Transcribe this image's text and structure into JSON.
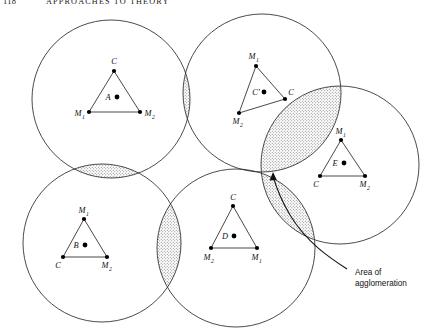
{
  "page": {
    "folio": "118",
    "running_head": "APPROACHES TO THEORY",
    "width": 424,
    "height": 331
  },
  "figure": {
    "name": "agglomeration-isodapane-diagram",
    "stroke_color": "#2b2b2b",
    "stipple_color": "#5a5a5a",
    "dense_fill_color": "#2a2a2a",
    "background": "#ffffff",
    "circles": [
      {
        "id": "circle-a",
        "cx": 111,
        "cy": 99,
        "r": 79
      },
      {
        "id": "circle-c",
        "cx": 262,
        "cy": 93,
        "r": 79
      },
      {
        "id": "circle-e",
        "cx": 340,
        "cy": 165,
        "r": 79
      },
      {
        "id": "circle-b",
        "cx": 102,
        "cy": 243,
        "r": 79
      },
      {
        "id": "circle-d",
        "cx": 236,
        "cy": 248,
        "r": 79
      }
    ],
    "triangles": [
      {
        "id": "triangle-a",
        "inner_label": "A",
        "inner_point": {
          "x": 117,
          "y": 97
        },
        "vertices": [
          {
            "label": "C",
            "sub": "",
            "x": 114,
            "y": 71,
            "anchor": "mid",
            "pos": "above"
          },
          {
            "label": "M",
            "sub": "1",
            "x": 89,
            "y": 112,
            "anchor": "right",
            "pos": "left"
          },
          {
            "label": "M",
            "sub": "2",
            "x": 140,
            "y": 112,
            "anchor": "left",
            "pos": "right"
          }
        ]
      },
      {
        "id": "triangle-c",
        "inner_label": "C'",
        "inner_point": {
          "x": 264,
          "y": 92
        },
        "vertices": [
          {
            "label": "M",
            "sub": "1",
            "x": 256,
            "y": 66,
            "anchor": "mid",
            "pos": "above"
          },
          {
            "label": "M",
            "sub": "2",
            "x": 239,
            "y": 113,
            "anchor": "mid",
            "pos": "below"
          },
          {
            "label": "C",
            "sub": "",
            "x": 285,
            "y": 99,
            "anchor": "left",
            "pos": "right"
          }
        ]
      },
      {
        "id": "triangle-e",
        "inner_label": "E",
        "inner_point": {
          "x": 344,
          "y": 163
        },
        "vertices": [
          {
            "label": "M",
            "sub": "1",
            "x": 341,
            "y": 140,
            "anchor": "mid",
            "pos": "above"
          },
          {
            "label": "C",
            "sub": "",
            "x": 320,
            "y": 176,
            "anchor": "right",
            "pos": "left"
          },
          {
            "label": "M",
            "sub": "2",
            "x": 365,
            "y": 176,
            "anchor": "left",
            "pos": "right"
          }
        ]
      },
      {
        "id": "triangle-b",
        "inner_label": "B",
        "inner_point": {
          "x": 85,
          "y": 245
        },
        "vertices": [
          {
            "label": "M",
            "sub": "1",
            "x": 84,
            "y": 219,
            "anchor": "mid",
            "pos": "above"
          },
          {
            "label": "C",
            "sub": "",
            "x": 63,
            "y": 257,
            "anchor": "right",
            "pos": "left"
          },
          {
            "label": "M",
            "sub": "2",
            "x": 107,
            "y": 257,
            "anchor": "left",
            "pos": "right"
          }
        ]
      },
      {
        "id": "triangle-d",
        "inner_label": "D",
        "inner_point": {
          "x": 234,
          "y": 236
        },
        "vertices": [
          {
            "label": "C",
            "sub": "",
            "x": 233,
            "y": 206,
            "anchor": "mid",
            "pos": "above"
          },
          {
            "label": "M",
            "sub": "2",
            "x": 211,
            "y": 248,
            "anchor": "mid",
            "pos": "below"
          },
          {
            "label": "M",
            "sub": "1",
            "x": 257,
            "y": 248,
            "anchor": "mid",
            "pos": "below"
          }
        ]
      }
    ],
    "annotation": {
      "line1": "Area of",
      "line2": "agglomeration",
      "x": 355,
      "y1": 272,
      "y2": 283
    }
  }
}
